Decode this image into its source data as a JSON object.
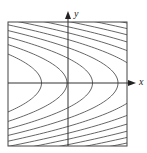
{
  "diagram": {
    "type": "level-curves",
    "axes": {
      "x_label": "x",
      "y_label": "y"
    },
    "frame": {
      "left": 8,
      "top": 22,
      "right": 127,
      "bottom": 146
    },
    "origin": {
      "x": 68,
      "y": 83
    },
    "curve": {
      "k": 0.04,
      "spacing": 25.5,
      "vertices_visible": [
        42,
        68,
        93,
        118
      ]
    },
    "colors": {
      "curve": "#555555",
      "axis": "#333333",
      "frame": "#444444"
    }
  }
}
